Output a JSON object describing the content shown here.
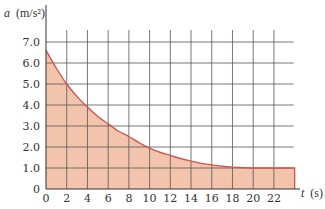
{
  "chart_data": {
    "type": "area",
    "title": "",
    "xlabel": "t (s)",
    "ylabel": "a (m/s²)",
    "xlabel_var": "t",
    "xlabel_unit": "(s)",
    "ylabel_var": "a",
    "ylabel_unit": "(m/s²)",
    "xlim": [
      0,
      24
    ],
    "ylim": [
      0,
      7.5
    ],
    "grid": true,
    "legend": null,
    "x_ticks": [
      0,
      2,
      4,
      6,
      8,
      10,
      12,
      14,
      16,
      18,
      20,
      22
    ],
    "y_ticks": [
      0,
      1.0,
      2.0,
      3.0,
      4.0,
      5.0,
      6.0,
      7.0
    ],
    "x_tick_labels": [
      "0",
      "2",
      "4",
      "6",
      "8",
      "10",
      "12",
      "14",
      "16",
      "18",
      "20",
      "22"
    ],
    "y_tick_labels": [
      "0",
      "1.0",
      "2.0",
      "3.0",
      "4.0",
      "5.0",
      "6.0",
      "7.0"
    ],
    "series": [
      {
        "name": "a(t)",
        "x": [
          0,
          1,
          2,
          3,
          4,
          5,
          6,
          7,
          8,
          9,
          10,
          11,
          12,
          13,
          14,
          15,
          16,
          17,
          18,
          19,
          20,
          21,
          22,
          23,
          24
        ],
        "values": [
          6.6,
          5.75,
          5.0,
          4.4,
          3.9,
          3.45,
          3.1,
          2.75,
          2.5,
          2.2,
          1.95,
          1.75,
          1.6,
          1.45,
          1.33,
          1.22,
          1.15,
          1.08,
          1.04,
          1.02,
          1.0,
          1.0,
          1.0,
          1.0,
          1.0
        ],
        "fill_under": true
      }
    ],
    "colors": {
      "fill": "#f2c4ab",
      "line": "#d9534f",
      "grid": "#555555",
      "axis": "#333333"
    }
  }
}
